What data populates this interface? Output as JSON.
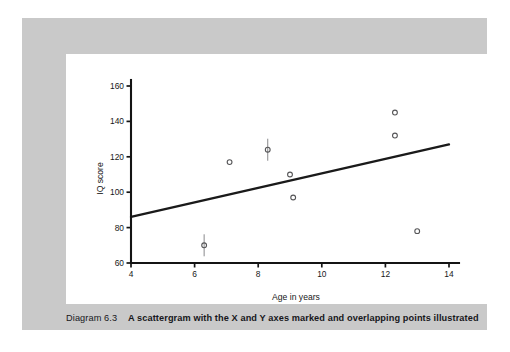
{
  "caption": {
    "label": "Diagram 6.3",
    "text": "A scattergram with the X and Y axes marked and overlapping points illustrated"
  },
  "colors": {
    "page_background": "#ffffff",
    "panel_background": "#c9c9c9",
    "card_background": "#ffffff",
    "axis": "#141414",
    "trend_line": "#1a1a1a",
    "marker_stroke": "#555557",
    "text": "#17171b"
  },
  "chart_data": {
    "type": "scatter",
    "title": "",
    "xlabel": "Age in years",
    "ylabel": "IQ score",
    "xlim": [
      4,
      14
    ],
    "ylim": [
      60,
      160
    ],
    "xticks": [
      4,
      6,
      8,
      10,
      12,
      14
    ],
    "yticks": [
      60,
      80,
      100,
      120,
      140,
      160
    ],
    "xtick_labels": [
      "4",
      "6",
      "8",
      "10",
      "12",
      "14"
    ],
    "ytick_labels": [
      "60",
      "80",
      "100",
      "120",
      "140",
      "160"
    ],
    "grid": false,
    "legend": false,
    "series": [
      {
        "name": "Single points",
        "marker": "open-circle",
        "points": [
          {
            "x": 7.1,
            "y": 117
          },
          {
            "x": 9.0,
            "y": 110
          },
          {
            "x": 9.1,
            "y": 97
          },
          {
            "x": 12.3,
            "y": 145
          },
          {
            "x": 12.3,
            "y": 132
          },
          {
            "x": 13.0,
            "y": 78
          }
        ]
      },
      {
        "name": "Overlapping points",
        "marker": "circle-with-vertical-bar",
        "points": [
          {
            "x": 6.3,
            "y": 70
          },
          {
            "x": 8.3,
            "y": 124
          }
        ]
      }
    ],
    "trend_line": {
      "name": "Best fit line",
      "x": [
        4,
        14
      ],
      "y": [
        86,
        127
      ]
    },
    "annotations": []
  }
}
